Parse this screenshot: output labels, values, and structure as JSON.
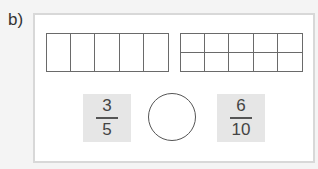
{
  "label": "b)",
  "bars": [
    {
      "name": "fifths",
      "columns": 5,
      "rows": 1
    },
    {
      "name": "tenths",
      "columns": 5,
      "rows": 2
    }
  ],
  "fractions": [
    {
      "numerator": "3",
      "denominator": "5"
    },
    {
      "numerator": "6",
      "denominator": "10"
    }
  ],
  "comparison_answer": ""
}
